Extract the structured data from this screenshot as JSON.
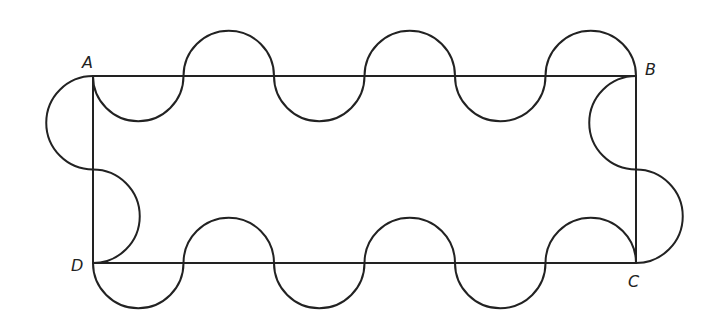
{
  "diagram": {
    "labels": {
      "A": "A",
      "B": "B",
      "C": "C",
      "D": "D"
    },
    "stroke_color": "#222222",
    "background": "#ffffff",
    "rectangle": {
      "A": [
        93,
        76
      ],
      "B": [
        636,
        76
      ],
      "C": [
        636,
        263
      ],
      "D": [
        93,
        263
      ]
    },
    "top_semicircles": 6,
    "bottom_semicircles": 6,
    "side_semicircles": 2
  }
}
